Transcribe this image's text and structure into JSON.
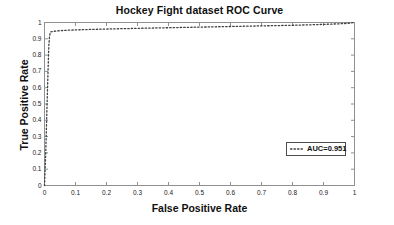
{
  "chart_data": {
    "type": "line",
    "title": "Hockey Fight dataset ROC Curve",
    "xlabel": "False Positive Rate",
    "ylabel": "True Positive Rate",
    "xlim": [
      0,
      1
    ],
    "ylim": [
      0,
      1
    ],
    "grid": false,
    "linestyle": "dotted",
    "color": "#404040",
    "legend_position": "center-right",
    "legend": [
      {
        "label": "AUC=0.951",
        "style": "dotted",
        "color": "#404040"
      }
    ],
    "xticks": [
      "0",
      "0.1",
      "0.2",
      "0.3",
      "0.4",
      "0.5",
      "0.6",
      "0.7",
      "0.8",
      "0.9",
      "1"
    ],
    "xtick_values": [
      0,
      0.1,
      0.2,
      0.3,
      0.4,
      0.5,
      0.6,
      0.7,
      0.8,
      0.9,
      1
    ],
    "yticks": [
      "0",
      "0.1",
      "0.2",
      "0.3",
      "0.4",
      "0.5",
      "0.6",
      "0.7",
      "0.8",
      "0.9",
      "1"
    ],
    "ytick_values": [
      0,
      0.1,
      0.2,
      0.3,
      0.4,
      0.5,
      0.6,
      0.7,
      0.8,
      0.9,
      1
    ],
    "series": [
      {
        "name": "AUC=0.951",
        "x": [
          0.0,
          0.004,
          0.008,
          0.012,
          0.014,
          0.016,
          0.018,
          0.02,
          0.03,
          0.05,
          0.08,
          0.12,
          0.18,
          0.25,
          0.32,
          0.4,
          0.48,
          0.56,
          0.64,
          0.72,
          0.8,
          0.86,
          0.91,
          0.95,
          0.97,
          0.985,
          0.995,
          1.0
        ],
        "y": [
          0.0,
          0.2,
          0.48,
          0.74,
          0.86,
          0.91,
          0.935,
          0.942,
          0.946,
          0.95,
          0.953,
          0.956,
          0.959,
          0.962,
          0.965,
          0.968,
          0.971,
          0.974,
          0.977,
          0.98,
          0.983,
          0.986,
          0.989,
          0.992,
          0.994,
          0.996,
          0.999,
          1.0
        ]
      }
    ],
    "annotations": {
      "auc_value": 0.951
    }
  },
  "axes": {
    "frame_color": "#808080",
    "background": "#ffffff"
  }
}
